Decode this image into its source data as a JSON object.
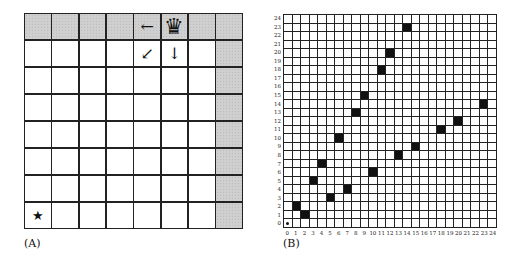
{
  "panelA": {
    "caption": "(A)",
    "board_size": 8,
    "shaded_cells": [
      [
        0,
        0
      ],
      [
        0,
        1
      ],
      [
        0,
        2
      ],
      [
        0,
        3
      ],
      [
        0,
        4
      ],
      [
        0,
        5
      ],
      [
        0,
        6
      ],
      [
        0,
        7
      ],
      [
        1,
        7
      ],
      [
        2,
        7
      ],
      [
        3,
        7
      ],
      [
        4,
        7
      ],
      [
        5,
        7
      ],
      [
        6,
        7
      ],
      [
        7,
        7
      ]
    ],
    "pieces": [
      {
        "row": 0,
        "col": 5,
        "type": "queen",
        "glyph": "♛",
        "icon": "queen-icon"
      },
      {
        "row": 0,
        "col": 4,
        "type": "arrow-left",
        "glyph": "←",
        "icon": "arrow-left-icon"
      },
      {
        "row": 1,
        "col": 4,
        "type": "arrow-down-left",
        "glyph": "↙",
        "icon": "arrow-down-left-icon"
      },
      {
        "row": 1,
        "col": 5,
        "type": "arrow-down",
        "glyph": "↓",
        "icon": "arrow-down-icon"
      },
      {
        "row": 7,
        "col": 0,
        "type": "star",
        "glyph": "★",
        "icon": "star-icon"
      }
    ]
  },
  "panelB": {
    "caption": "(B)",
    "grid_size": 25,
    "x_ticks": [
      "0",
      "1",
      "2",
      "3",
      "4",
      "5",
      "6",
      "7",
      "8",
      "9",
      "10",
      "11",
      "12",
      "13",
      "14",
      "15",
      "16",
      "17",
      "18",
      "19",
      "20",
      "21",
      "22",
      "23",
      "24"
    ],
    "y_ticks": [
      "0",
      "1",
      "2",
      "3",
      "4",
      "5",
      "6",
      "7",
      "8",
      "9",
      "10",
      "11",
      "12",
      "13",
      "14",
      "15",
      "16",
      "17",
      "18",
      "19",
      "20",
      "21",
      "22",
      "23",
      "24"
    ],
    "origin_marker": {
      "x": 0,
      "y": 0
    },
    "filled_cells": [
      {
        "x": 1,
        "y": 2
      },
      {
        "x": 2,
        "y": 1
      },
      {
        "x": 3,
        "y": 5
      },
      {
        "x": 4,
        "y": 7
      },
      {
        "x": 5,
        "y": 3
      },
      {
        "x": 6,
        "y": 10
      },
      {
        "x": 7,
        "y": 4
      },
      {
        "x": 8,
        "y": 13
      },
      {
        "x": 9,
        "y": 15
      },
      {
        "x": 10,
        "y": 6
      },
      {
        "x": 11,
        "y": 18
      },
      {
        "x": 12,
        "y": 20
      },
      {
        "x": 13,
        "y": 8
      },
      {
        "x": 14,
        "y": 23
      },
      {
        "x": 15,
        "y": 9
      },
      {
        "x": 18,
        "y": 11
      },
      {
        "x": 20,
        "y": 12
      },
      {
        "x": 23,
        "y": 14
      }
    ]
  },
  "colors": {
    "grid_line": "#222222",
    "shaded": "#cfcfcf",
    "filled": "#111111",
    "background": "#ffffff"
  }
}
